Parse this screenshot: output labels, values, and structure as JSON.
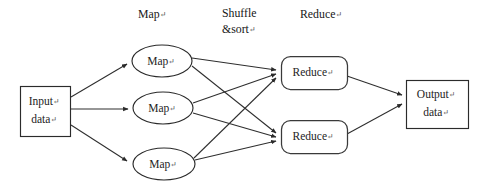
{
  "diagram": {
    "type": "flowchart",
    "paragraph_mark": "↵",
    "background_color": "#ffffff",
    "line_color": "#2e2e2e",
    "text_color": "#1d1d1d",
    "stage_headers": [
      {
        "id": "header-map",
        "label": "Map",
        "x": 138,
        "y": 15
      },
      {
        "id": "header-shuffle-line1",
        "label": "Shuffle",
        "x": 222,
        "y": 14
      },
      {
        "id": "header-shuffle-line2",
        "label": "&sort",
        "x": 222,
        "y": 30
      },
      {
        "id": "header-reduce",
        "label": "Reduce",
        "x": 300,
        "y": 15
      }
    ],
    "nodes": [
      {
        "id": "input-data",
        "shape": "rectangle",
        "label_line1": "Input",
        "label_line2": "data",
        "x": 20,
        "y": 86,
        "width": 50,
        "height": 50
      },
      {
        "id": "map-1",
        "shape": "ellipse",
        "label": "Map",
        "cx": 162,
        "cy": 61,
        "rx": 30,
        "ry": 16
      },
      {
        "id": "map-2",
        "shape": "ellipse",
        "label": "Map",
        "cx": 163,
        "cy": 108,
        "rx": 30,
        "ry": 16
      },
      {
        "id": "map-3",
        "shape": "ellipse",
        "label": "Map",
        "cx": 164,
        "cy": 164,
        "rx": 31,
        "ry": 16
      },
      {
        "id": "reduce-1",
        "shape": "rounded-rectangle",
        "label": "Reduce",
        "x": 281,
        "y": 56,
        "width": 66,
        "height": 33
      },
      {
        "id": "reduce-2",
        "shape": "rounded-rectangle",
        "label": "Reduce",
        "x": 281,
        "y": 120,
        "width": 66,
        "height": 33
      },
      {
        "id": "output-data",
        "shape": "rectangle",
        "label_line1": "Output",
        "label_line2": "data",
        "x": 406,
        "y": 80,
        "width": 62,
        "height": 48
      }
    ],
    "edges": [
      {
        "id": "input-to-map-1",
        "from": "input-data",
        "to": "map-1",
        "arrow": true
      },
      {
        "id": "input-to-map-2",
        "from": "input-data",
        "to": "map-2",
        "arrow": true
      },
      {
        "id": "input-to-map-3",
        "from": "input-data",
        "to": "map-3",
        "arrow": true
      },
      {
        "id": "map-1-to-reduce-1",
        "from": "map-1",
        "to": "reduce-1",
        "arrow": true
      },
      {
        "id": "map-1-to-reduce-2",
        "from": "map-1",
        "to": "reduce-2",
        "arrow": true
      },
      {
        "id": "map-2-to-reduce-1",
        "from": "map-2",
        "to": "reduce-1",
        "arrow": true
      },
      {
        "id": "map-2-to-reduce-2",
        "from": "map-2",
        "to": "reduce-2",
        "arrow": true
      },
      {
        "id": "map-3-to-reduce-1",
        "from": "map-3",
        "to": "reduce-1",
        "arrow": true
      },
      {
        "id": "map-3-to-reduce-2",
        "from": "map-3",
        "to": "reduce-2",
        "arrow": true
      },
      {
        "id": "reduce-1-to-output",
        "from": "reduce-1",
        "to": "output-data",
        "arrow": true
      },
      {
        "id": "reduce-2-to-output",
        "from": "reduce-2",
        "to": "output-data",
        "arrow": true
      }
    ]
  }
}
